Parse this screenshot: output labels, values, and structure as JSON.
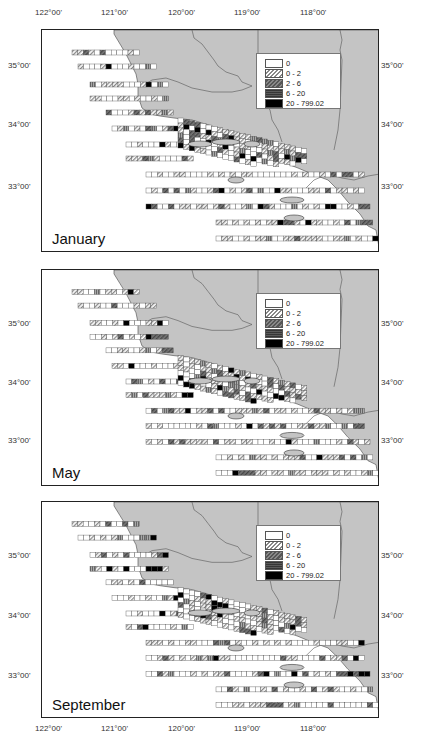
{
  "figure": {
    "x_ticks": [
      "122°00'",
      "121°00'",
      "120°00'",
      "119°00'",
      "118°00'"
    ],
    "y_ticks": [
      "35°00'",
      "34°00'",
      "33°00'"
    ],
    "legend": {
      "title": "",
      "entries": [
        {
          "label": "0",
          "class": 0
        },
        {
          "label": "0 - 2",
          "class": 1
        },
        {
          "label": "2 - 6",
          "class": 2
        },
        {
          "label": "6 - 20",
          "class": 3
        },
        {
          "label": "20 - 799.02",
          "class": 4
        }
      ]
    },
    "panels": [
      {
        "month": "January"
      },
      {
        "month": "May"
      },
      {
        "month": "September"
      }
    ],
    "colors": {
      "land": "#c4c4c4",
      "ocean": "#ffffff",
      "border": "#222222",
      "class_0": "#ffffff",
      "class_1": "#d0d0d0",
      "class_2": "#666666",
      "class_3": "#8a8a8a",
      "class_4": "#000000"
    }
  },
  "chart_data": {
    "type": "heatmap",
    "title": "",
    "panels": [
      "January",
      "May",
      "September"
    ],
    "xlabel": "Longitude",
    "ylabel": "Latitude",
    "x_tick_labels": [
      "122°00'",
      "121°00'",
      "120°00'",
      "119°00'",
      "118°00'"
    ],
    "y_tick_labels": [
      "35°00'",
      "34°00'",
      "33°00'"
    ],
    "legend": [
      "0",
      "0 - 2",
      "2 - 6",
      "6 - 20",
      "20 - 799.02"
    ],
    "legend_position": "upper right inside each panel",
    "grid": false
  }
}
